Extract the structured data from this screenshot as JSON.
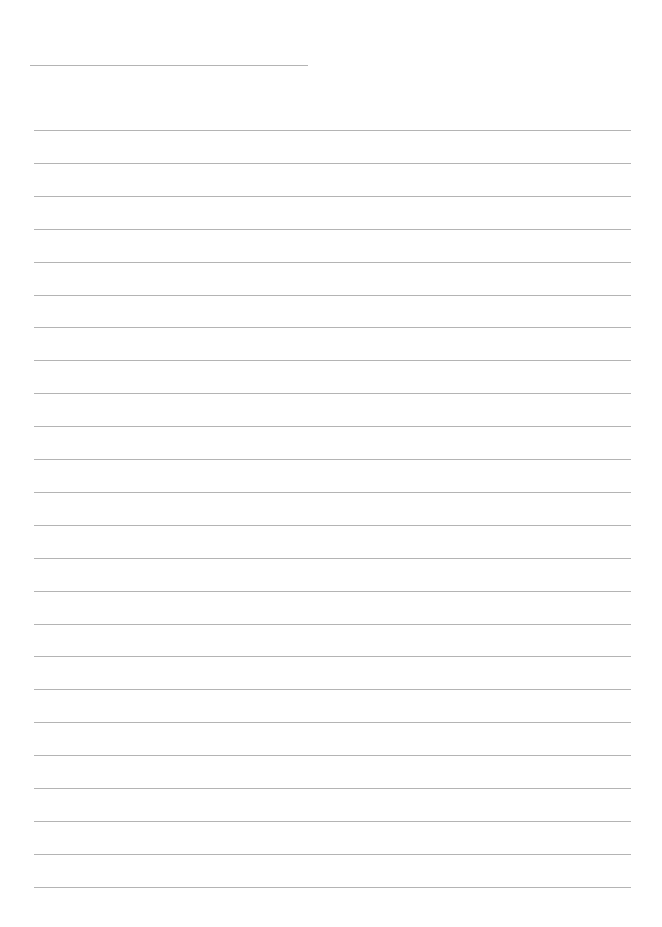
{
  "document": {
    "type": "ruled-notepaper",
    "title_line": {
      "present": true,
      "text": ""
    },
    "ruled_lines": {
      "count": 24,
      "first_y": 130,
      "spacing": 32.9,
      "line_color": "#b4b4b4",
      "content": [
        "",
        "",
        "",
        "",
        "",
        "",
        "",
        "",
        "",
        "",
        "",
        "",
        "",
        "",
        "",
        "",
        "",
        "",
        "",
        "",
        "",
        "",
        "",
        ""
      ]
    },
    "background_color": "#ffffff"
  }
}
